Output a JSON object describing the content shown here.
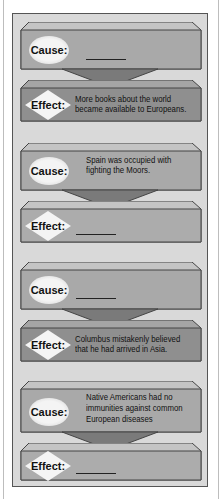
{
  "diagram": {
    "type": "cause-effect chain",
    "colors": {
      "frame_bg": "#d9d9d9",
      "cause_box": "#a9a9a9",
      "effect_box": "#8f8f8f",
      "arrow": "#7a7a7a",
      "label_shape": "#f4f4f4"
    },
    "pairs": [
      {
        "cause": {
          "label": "Cause:",
          "lines": [],
          "blank": true
        },
        "effect": {
          "label": "Effect:",
          "lines": [
            "More books about the world",
            "became available to Europeans."
          ],
          "blank": false
        }
      },
      {
        "cause": {
          "label": "Cause:",
          "lines": [
            "Spain was occupied with",
            "fighting the Moors."
          ],
          "blank": false
        },
        "effect": {
          "label": "Effect:",
          "lines": [],
          "blank": true
        }
      },
      {
        "cause": {
          "label": "Cause:",
          "lines": [],
          "blank": true
        },
        "effect": {
          "label": "Effect:",
          "lines": [
            "Columbus mistakenly believed",
            "that he had arrived in Asia."
          ],
          "blank": false
        }
      },
      {
        "cause": {
          "label": "Cause:",
          "lines": [
            "Native Americans had no",
            "immunities against common",
            "European diseases"
          ],
          "blank": false
        },
        "effect": {
          "label": "Effect:",
          "lines": [],
          "blank": true
        }
      }
    ]
  }
}
